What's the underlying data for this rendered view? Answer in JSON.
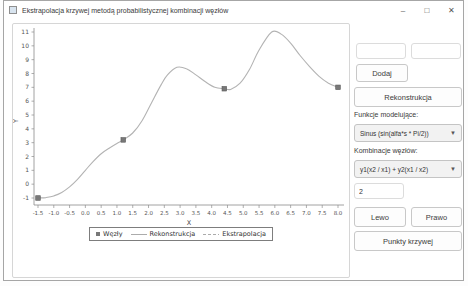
{
  "window": {
    "title": "Ekstrapolacja krzywej metodą probabilistycznej kombinacji węzłów",
    "minimize_glyph": "–",
    "maximize_glyph": "□",
    "close_glyph": "✕"
  },
  "chart": {
    "xlabel": "X",
    "ylabel": "Y",
    "legend": [
      {
        "label": "Węzły",
        "marker": "square"
      },
      {
        "label": "Rekonstrukcja",
        "marker": "solid-line"
      },
      {
        "label": "Ekstrapolacja",
        "marker": "dashed-line"
      }
    ],
    "colors": {
      "curve": "#b3b3b3",
      "node_fill": "#787878",
      "node_edge": "#5a5a5a",
      "axis": "#8c8c8c",
      "tick_text": "#555555"
    }
  },
  "chart_data": {
    "type": "line",
    "title": "",
    "xlabel": "X",
    "ylabel": "Y",
    "xlim": [
      -1.5,
      8.0
    ],
    "ylim": [
      -1,
      11
    ],
    "grid": false,
    "legend_position": "bottom-center",
    "x_ticks": [
      -1.5,
      -1.0,
      -0.5,
      0.0,
      0.5,
      1.0,
      1.5,
      2.0,
      2.5,
      3.0,
      3.5,
      4.0,
      4.5,
      5.0,
      5.5,
      6.0,
      6.5,
      7.0,
      7.5,
      8.0
    ],
    "y_ticks": [
      -1,
      0,
      1,
      2,
      3,
      4,
      5,
      6,
      7,
      8,
      9,
      10,
      11
    ],
    "series": [
      {
        "name": "Węzły",
        "type": "scatter",
        "marker": "square",
        "points": [
          [
            -1.5,
            -1.0
          ],
          [
            1.2,
            3.2
          ],
          [
            4.4,
            6.9
          ],
          [
            8.0,
            7.0
          ]
        ]
      },
      {
        "name": "Rekonstrukcja",
        "type": "line",
        "style": "solid",
        "points": [
          [
            -1.5,
            -1.0
          ],
          [
            -1.25,
            -0.97
          ],
          [
            -1.0,
            -0.85
          ],
          [
            -0.75,
            -0.6
          ],
          [
            -0.5,
            -0.2
          ],
          [
            -0.25,
            0.35
          ],
          [
            0.0,
            1.0
          ],
          [
            0.25,
            1.65
          ],
          [
            0.5,
            2.2
          ],
          [
            0.75,
            2.6
          ],
          [
            1.0,
            2.95
          ],
          [
            1.2,
            3.2
          ],
          [
            1.5,
            3.7
          ],
          [
            1.8,
            4.6
          ],
          [
            2.1,
            5.9
          ],
          [
            2.4,
            7.2
          ],
          [
            2.6,
            7.9
          ],
          [
            2.9,
            8.45
          ],
          [
            3.2,
            8.35
          ],
          [
            3.5,
            7.9
          ],
          [
            3.8,
            7.4
          ],
          [
            4.1,
            7.0
          ],
          [
            4.4,
            6.9
          ],
          [
            4.6,
            6.85
          ],
          [
            4.9,
            7.3
          ],
          [
            5.2,
            8.3
          ],
          [
            5.5,
            9.7
          ],
          [
            5.9,
            11.0
          ],
          [
            6.2,
            10.85
          ],
          [
            6.5,
            10.2
          ],
          [
            6.8,
            9.3
          ],
          [
            7.1,
            8.5
          ],
          [
            7.4,
            7.8
          ],
          [
            7.7,
            7.3
          ],
          [
            8.0,
            7.0
          ]
        ]
      },
      {
        "name": "Ekstrapolacja",
        "type": "line",
        "style": "dashed",
        "points": []
      }
    ]
  },
  "panel": {
    "inputs": {
      "node_x": {
        "value": "",
        "placeholder": ""
      },
      "node_y": {
        "value": "",
        "placeholder": ""
      },
      "count": {
        "value": "2",
        "placeholder": ""
      }
    },
    "buttons": {
      "dodaj": "Dodaj",
      "rekonstrukcja": "Rekonstrukcja",
      "lewo": "Lewo",
      "prawo": "Prawo",
      "punkty_krzywej": "Punkty krzywej"
    },
    "labels": {
      "funkcje": "Funkcje modelujące:",
      "kombinacje": "Kombinacje węzłów:"
    },
    "dropdowns": {
      "funkcja": {
        "value": "Sinus (sin(alfa*s * Pi/2))"
      },
      "kombinacja": {
        "value": "y1(x2 / x1) + y2(x1 / x2)"
      }
    }
  }
}
